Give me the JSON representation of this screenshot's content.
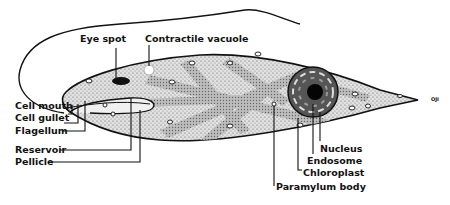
{
  "diagram": {
    "colors": {
      "outline": "#111111",
      "cytoplasm": "#d4d4d4",
      "chloroplast_band": "#b2b2b2",
      "background": "#ffffff"
    },
    "labels": {
      "eye_spot": "Eye spot",
      "contractile_vacuole": "Contractile vacuole",
      "cell_mouth": "Cell mouth",
      "cell_gullet": "Cell gullet",
      "flagellum": "Flagellum",
      "reservoir": "Reservoir",
      "pellicle": "Pellicle",
      "nucleus": "Nucleus",
      "endosome": "Endosome",
      "chloroplast": "Chloroplast",
      "paramylum_body": "Paramylum body"
    },
    "signature": "OJI"
  }
}
